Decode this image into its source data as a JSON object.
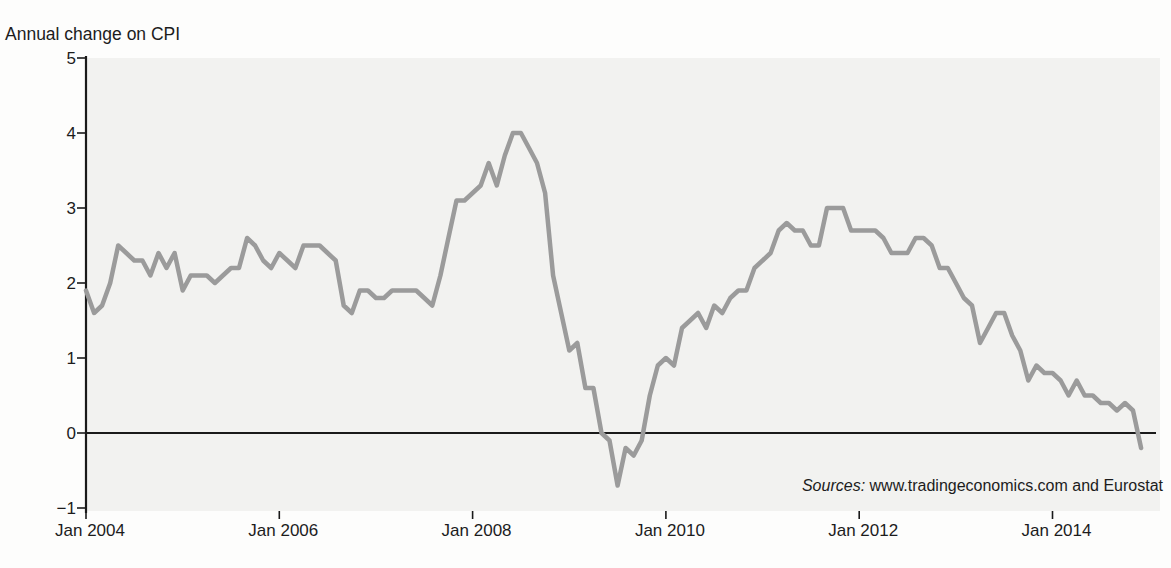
{
  "page": {
    "title": "Annual change on CPI"
  },
  "source_note": {
    "label": "Sources:",
    "text": " www.tradingeconomics.com and Eurostat"
  },
  "colors": {
    "line": "#9b9b9b",
    "panel": "#f2f2f0",
    "axis": "#1a1a1a",
    "text": "#1c1c1c"
  },
  "chart_data": {
    "type": "line",
    "title": "Annual change on CPI",
    "series_name": "Annual change in CPI (%)",
    "x_start": "Jan 2004",
    "x_end": "Dec 2014",
    "frequency": "monthly",
    "x_tick_labels": [
      "Jan 2004",
      "Jan 2006",
      "Jan 2008",
      "Jan 2010",
      "Jan 2012",
      "Jan 2014"
    ],
    "y_ticks": [
      5,
      4,
      3,
      2,
      1,
      0,
      -1
    ],
    "ylim": [
      -1,
      5
    ],
    "grid": false,
    "zero_line": true,
    "legend": "none",
    "values": [
      1.9,
      1.6,
      1.7,
      2.0,
      2.5,
      2.4,
      2.3,
      2.3,
      2.1,
      2.4,
      2.2,
      2.4,
      1.9,
      2.1,
      2.1,
      2.1,
      2.0,
      2.1,
      2.2,
      2.2,
      2.6,
      2.5,
      2.3,
      2.2,
      2.4,
      2.3,
      2.2,
      2.5,
      2.5,
      2.5,
      2.4,
      2.3,
      1.7,
      1.6,
      1.9,
      1.9,
      1.8,
      1.8,
      1.9,
      1.9,
      1.9,
      1.9,
      1.8,
      1.7,
      2.1,
      2.6,
      3.1,
      3.1,
      3.2,
      3.3,
      3.6,
      3.3,
      3.7,
      4.0,
      4.0,
      3.8,
      3.6,
      3.2,
      2.1,
      1.6,
      1.1,
      1.2,
      0.6,
      0.6,
      0.0,
      -0.1,
      -0.7,
      -0.2,
      -0.3,
      -0.1,
      0.5,
      0.9,
      1.0,
      0.9,
      1.4,
      1.5,
      1.6,
      1.4,
      1.7,
      1.6,
      1.8,
      1.9,
      1.9,
      2.2,
      2.3,
      2.4,
      2.7,
      2.8,
      2.7,
      2.7,
      2.5,
      2.5,
      3.0,
      3.0,
      3.0,
      2.7,
      2.7,
      2.7,
      2.7,
      2.6,
      2.4,
      2.4,
      2.4,
      2.6,
      2.6,
      2.5,
      2.2,
      2.2,
      2.0,
      1.8,
      1.7,
      1.2,
      1.4,
      1.6,
      1.6,
      1.3,
      1.1,
      0.7,
      0.9,
      0.8,
      0.8,
      0.7,
      0.5,
      0.7,
      0.5,
      0.5,
      0.4,
      0.4,
      0.3,
      0.4,
      0.3,
      -0.2
    ]
  }
}
